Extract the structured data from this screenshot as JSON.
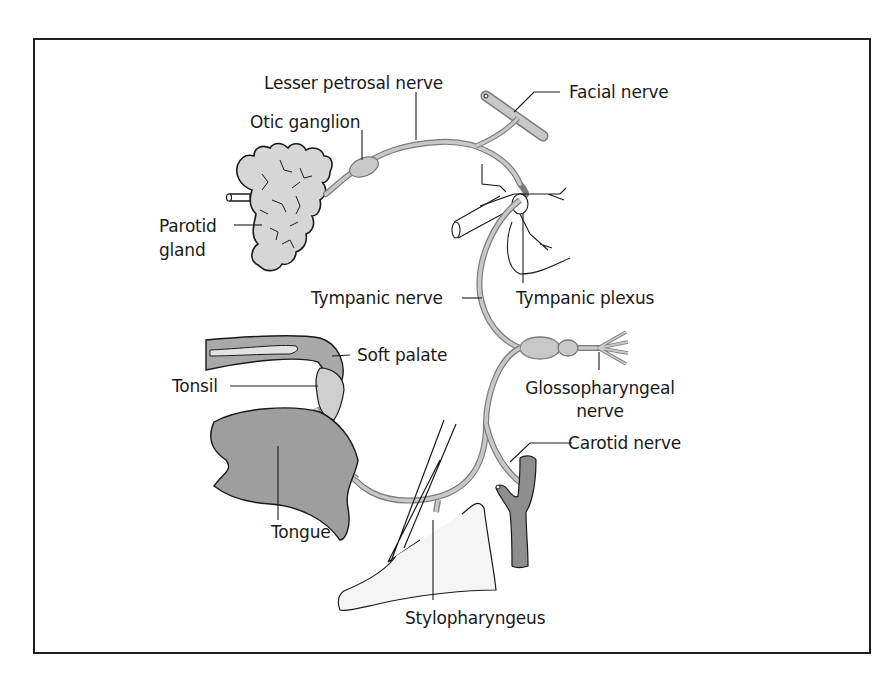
{
  "diagram": {
    "type": "anatomical-illustration",
    "colors": {
      "nerve_fill": "#c8c8c8",
      "nerve_stroke": "#7a7a7a",
      "gland_fill": "#d6d6d6",
      "tongue_fill": "#9e9e9e",
      "artery_fill": "#8e8e8e",
      "outline": "#1a1a1a",
      "frame": "#1e1e1e"
    },
    "labels": {
      "lesser_petrosal_nerve": "Lesser petrosal nerve",
      "facial_nerve": "Facial nerve",
      "otic_ganglion": "Otic ganglion",
      "parotid_gland_line1": "Parotid",
      "parotid_gland_line2": "gland",
      "tympanic_nerve": "Tympanic nerve",
      "tympanic_plexus": "Tympanic plexus",
      "soft_palate": "Soft palate",
      "tonsil": "Tonsil",
      "glossopharyngeal_line1": "Glossopharyngeal",
      "glossopharyngeal_line2": "nerve",
      "carotid_nerve": "Carotid nerve",
      "tongue": "Tongue",
      "stylopharyngeus": "Stylopharyngeus"
    }
  }
}
